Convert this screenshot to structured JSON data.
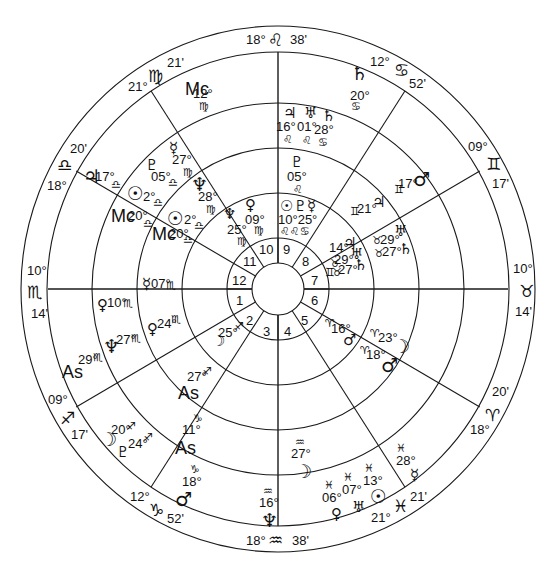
{
  "chart": {
    "type": "astrological tri-wheel",
    "center": [
      278,
      289
    ],
    "radii": [
      260,
      234,
      186,
      141,
      95,
      50,
      25
    ],
    "house_cusps_outer": [
      {
        "id": "mc",
        "deg": "18°",
        "sign": "♌",
        "min": "38'"
      },
      {
        "id": "c11",
        "deg": "12°",
        "sign": "♋",
        "min": "52'"
      },
      {
        "id": "c12",
        "deg": "09°",
        "sign": "♊",
        "min": "17'"
      },
      {
        "id": "asc",
        "deg": "10°",
        "sign": "♉",
        "min": "14'"
      },
      {
        "id": "c2",
        "deg": "18°",
        "sign": "♈",
        "min": "20'"
      },
      {
        "id": "c3",
        "deg": "21°",
        "sign": "♓",
        "min": "21'"
      },
      {
        "id": "ic",
        "deg": "18°",
        "sign": "♒",
        "min": "38'"
      },
      {
        "id": "c5",
        "deg": "12°",
        "sign": "♑",
        "min": "52'"
      },
      {
        "id": "c6",
        "deg": "09°",
        "sign": "♐",
        "min": "17'"
      },
      {
        "id": "dsc",
        "deg": "10°",
        "sign": "♏",
        "min": "14'"
      },
      {
        "id": "c8",
        "deg": "18°",
        "sign": "♎",
        "min": "20'"
      },
      {
        "id": "c9",
        "deg": "21°",
        "sign": "♍",
        "min": "21'"
      }
    ],
    "house_numbers": [
      "1",
      "2",
      "3",
      "4",
      "5",
      "6",
      "7",
      "8",
      "9",
      "10",
      "11",
      "12"
    ],
    "outer_ring_planets": [
      {
        "glyph": "♄",
        "deg": "20°",
        "sign": "♋"
      },
      {
        "glyph": "♂",
        "deg": "17°",
        "sign": "♊"
      },
      {
        "glyph": "♃",
        "deg": "21°",
        "sign": "♊"
      },
      {
        "glyph": "☽",
        "deg": "23°",
        "sign": "♈"
      },
      {
        "glyph": "☿",
        "deg": "28°",
        "sign": "♓"
      },
      {
        "glyph": "☉",
        "deg": "13°",
        "sign": "♓"
      },
      {
        "glyph": "♅",
        "deg": "07°",
        "sign": "♓"
      },
      {
        "glyph": "♀",
        "deg": "06°",
        "sign": "♓"
      },
      {
        "glyph": "☽",
        "deg": "27°",
        "sign": "♒"
      },
      {
        "glyph": "♆",
        "deg": "16°",
        "sign": "♒"
      },
      {
        "glyph": "♂",
        "deg": "18°",
        "sign": "♑"
      },
      {
        "glyph": "☽",
        "deg": "20°",
        "sign": "♐"
      },
      {
        "glyph": "♇",
        "deg": "24°",
        "sign": "♐"
      },
      {
        "glyph": "As",
        "deg": "29°",
        "sign": "♏"
      },
      {
        "glyph": "♆",
        "deg": "27°",
        "sign": "♏"
      },
      {
        "glyph": "♀",
        "deg": "10°",
        "sign": "♏"
      },
      {
        "glyph": "♃",
        "deg": "17°",
        "sign": "♎"
      },
      {
        "glyph": "Mc",
        "deg": "12°",
        "sign": "♍"
      }
    ],
    "middle_ring_planets": [
      {
        "glyph": "♃",
        "deg": "16°",
        "sign": "♌"
      },
      {
        "glyph": "♅",
        "deg": "01°",
        "sign": "♌"
      },
      {
        "glyph": "♄",
        "deg": "28°",
        "sign": "♋"
      },
      {
        "glyph": "♅",
        "deg": "29°",
        "sign": "♉"
      },
      {
        "glyph": "♄",
        "deg": "27°",
        "sign": "♉"
      },
      {
        "glyph": "♂",
        "deg": "18°",
        "sign": "♈"
      },
      {
        "glyph": "As",
        "deg": "11°",
        "sign": "♑"
      },
      {
        "glyph": "As",
        "deg": "27°",
        "sign": "♐"
      },
      {
        "glyph": "♀",
        "deg": "24°",
        "sign": "♏"
      },
      {
        "glyph": "☿",
        "deg": "07°",
        "sign": "♏"
      },
      {
        "glyph": "Mc",
        "deg": "20°",
        "sign": "♎"
      },
      {
        "glyph": "☉",
        "deg": "2°",
        "sign": "♎"
      },
      {
        "glyph": "♇",
        "deg": "05°",
        "sign": "♎"
      },
      {
        "glyph": "☿",
        "deg": "27°",
        "sign": "♍"
      },
      {
        "glyph": "♆",
        "deg": "28°",
        "sign": "♍"
      }
    ],
    "inner_ring_planets": [
      {
        "glyph": "♇",
        "deg": "05°",
        "sign": "♌"
      },
      {
        "glyph": "♃",
        "deg": "14°",
        "sign": "♊"
      },
      {
        "glyph": "♅",
        "deg": "29°",
        "sign": "♉"
      },
      {
        "glyph": "♄",
        "deg": "27°",
        "sign": "♉"
      },
      {
        "glyph": "♂",
        "deg": "16°",
        "sign": "♈"
      },
      {
        "glyph": "☽",
        "deg": "25°",
        "sign": "♐"
      },
      {
        "glyph": "Mc",
        "deg": "20°",
        "sign": "♎"
      },
      {
        "glyph": "☉",
        "deg": "2°",
        "sign": "♎"
      },
      {
        "glyph": "♆",
        "deg": "25°",
        "sign": "♍"
      },
      {
        "glyph": "♀",
        "deg": "09°",
        "sign": "♍"
      },
      {
        "glyph": "☉♇☿",
        "deg": "10°25°",
        "sign": "♌♌♋"
      }
    ]
  }
}
